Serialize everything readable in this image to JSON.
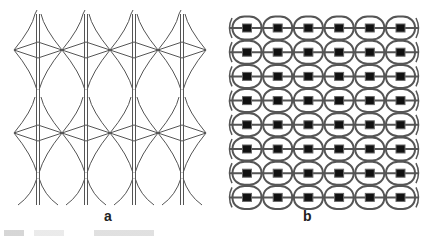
{
  "panels": [
    {
      "id": "a",
      "label": "a",
      "description": "Repeating star/diamond lattice pattern, 4 columns",
      "columns": 4,
      "rows": 2
    },
    {
      "id": "b",
      "label": "b",
      "description": "Grid of rounded circles with square centers joined by horizontal bars",
      "columns": 6,
      "rows": 8
    }
  ],
  "colors": {
    "stroke": "#555555",
    "fill_square": "#111111",
    "background": "#ffffff"
  }
}
